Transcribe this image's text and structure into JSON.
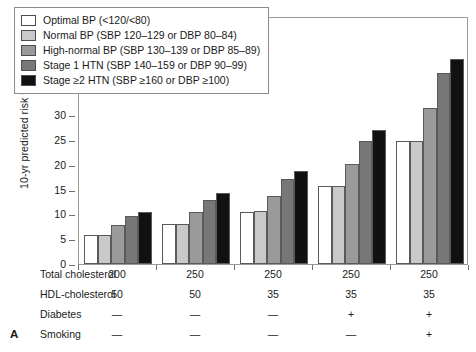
{
  "panel_letter": "A",
  "chart_data": {
    "type": "bar",
    "title": "",
    "xlabel": "",
    "ylabel": "10-yr predicted risk for IHD (%)",
    "ylim": [
      0,
      50
    ],
    "ytick_step": 5,
    "yticks": [
      0,
      5,
      10,
      15,
      20,
      25,
      30,
      35,
      40,
      45,
      50
    ],
    "grid": false,
    "legend_position": "upper-left-inside",
    "categories": [
      "Group 1",
      "Group 2",
      "Group 3",
      "Group 4",
      "Group 5"
    ],
    "series": [
      {
        "name": "Optimal BP (<120/<80)",
        "color": "#ffffff",
        "values": [
          5.9,
          8.0,
          10.4,
          15.7,
          24.9
        ]
      },
      {
        "name": "Normal BP (SBP 120–129 or DBP 80–84)",
        "color": "#c9c9c9",
        "values": [
          5.9,
          8.0,
          10.6,
          15.7,
          24.9
        ]
      },
      {
        "name": "High-normal BP (SBP 130–139 or DBP 85–89)",
        "color": "#9a9a9a",
        "values": [
          7.8,
          10.5,
          13.8,
          20.2,
          31.5
        ]
      },
      {
        "name": "Stage 1 HTN (SBP 140–159 or DBP 90–99)",
        "color": "#777777",
        "values": [
          9.6,
          13.0,
          17.2,
          24.9,
          38.5
        ]
      },
      {
        "name": "Stage ≥2 HTN (SBP ≥160 or DBP ≥100)",
        "color": "#111111",
        "values": [
          10.5,
          14.3,
          18.7,
          27.1,
          41.4
        ]
      }
    ]
  },
  "legend": {
    "items": [
      {
        "label": "Optimal BP (<120/<80)",
        "color": "#ffffff"
      },
      {
        "label": "Normal BP (SBP 120–129 or DBP 80–84)",
        "color": "#c9c9c9"
      },
      {
        "label": "High-normal BP (SBP 130–139 or DBP 85–89)",
        "color": "#9a9a9a"
      },
      {
        "label": "Stage 1 HTN (SBP 140–159 or DBP 90–99)",
        "color": "#777777"
      },
      {
        "label": "Stage ≥2 HTN (SBP ≥160 or DBP ≥100)",
        "color": "#111111"
      }
    ]
  },
  "table": {
    "rows": [
      {
        "label": "Total cholesterol",
        "values": [
          "200",
          "250",
          "250",
          "250",
          "250"
        ]
      },
      {
        "label": "HDL-cholesterol",
        "values": [
          "50",
          "50",
          "35",
          "35",
          "35"
        ]
      },
      {
        "label": "Diabetes",
        "values": [
          "—",
          "—",
          "—",
          "+",
          "+"
        ]
      },
      {
        "label": "Smoking",
        "values": [
          "—",
          "—",
          "—",
          "—",
          "+"
        ]
      }
    ]
  }
}
